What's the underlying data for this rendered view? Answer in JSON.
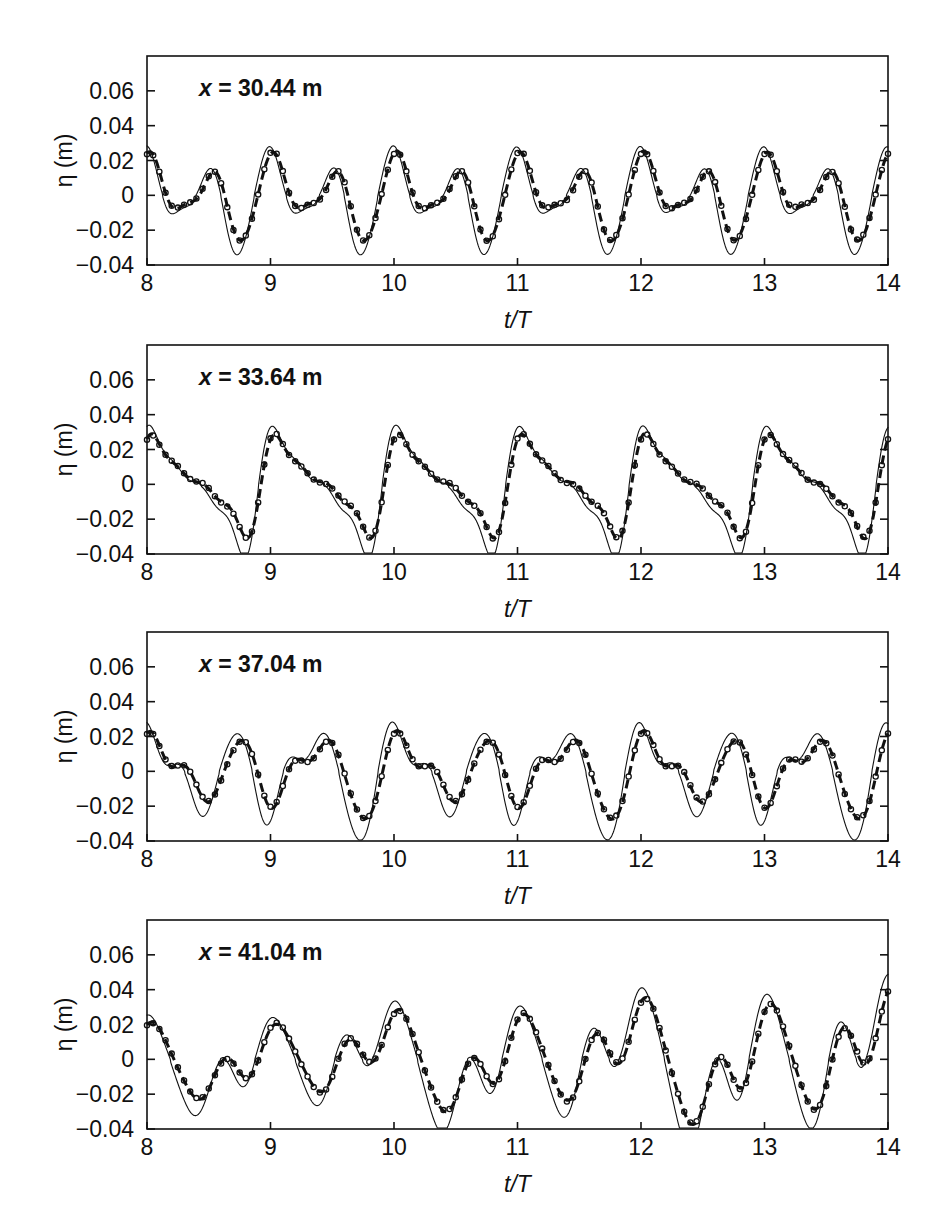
{
  "figure": {
    "title": "",
    "panel_count": 4
  },
  "axes": {
    "xlabel": "t/T",
    "ylabel": "η (m)",
    "xticks": [
      "8",
      "9",
      "10",
      "11",
      "12",
      "13",
      "14"
    ],
    "xtick_values": [
      8,
      9,
      10,
      11,
      12,
      13,
      14
    ],
    "yticks": [
      "0.06",
      "0.04",
      "0.02",
      "0",
      "−0.02",
      "−0.04"
    ],
    "ytick_values": [
      0.06,
      0.04,
      0.02,
      0,
      -0.02,
      -0.04
    ],
    "xlim": [
      8,
      14
    ],
    "ylim": [
      -0.04,
      0.08
    ],
    "grid": false,
    "line_color": "#111111"
  },
  "legend": {
    "series_names": [
      "solid-line",
      "dashed-line",
      "circle-markers"
    ],
    "position": "none"
  },
  "panels": [
    {
      "id": "panel-1",
      "note_prefix": "x",
      "note_equals": "=",
      "note_value": "30.44 m",
      "note": "x = 30.44 m"
    },
    {
      "id": "panel-2",
      "note_prefix": "x",
      "note_equals": "=",
      "note_value": "33.64 m",
      "note": "x = 33.64 m"
    },
    {
      "id": "panel-3",
      "note_prefix": "x",
      "note_equals": "=",
      "note_value": "37.04 m",
      "note": "x = 37.04 m"
    },
    {
      "id": "panel-4",
      "note_prefix": "x",
      "note_equals": "=",
      "note_value": "41.04 m",
      "note": "x = 41.04 m"
    }
  ],
  "chart_data": [
    {
      "type": "line",
      "title": "x = 30.44 m",
      "xlabel": "t/T",
      "ylabel": "η (m)",
      "xlim": [
        8,
        14
      ],
      "ylim": [
        -0.04,
        0.08
      ],
      "grid": false,
      "harmonics": [
        {
          "name": "primary",
          "amp": 0.0175,
          "freq": 2.0,
          "phase": 1.3,
          "mean": 0.0
        },
        {
          "name": "secondary",
          "amp": 0.0075,
          "freq": 1.0,
          "phase": 0.55,
          "mean": 0.0
        },
        {
          "name": "third",
          "amp": 0.004,
          "freq": 3.0,
          "phase": 2.4,
          "mean": 0.0
        },
        {
          "name": "fourth",
          "amp": 0.0022,
          "freq": 4.0,
          "phase": 0.2,
          "mean": 0.0
        }
      ],
      "series": [
        {
          "name": "solid-line",
          "style": "solid",
          "amp_scale": 1.12,
          "trough_bias": -0.0028,
          "phase_shift": 0.03
        },
        {
          "name": "dashed-line",
          "style": "dashed",
          "amp_scale": 1.0,
          "trough_bias": 0.0,
          "phase_shift": 0.0
        },
        {
          "name": "circle-markers",
          "style": "markers",
          "amp_scale": 1.0,
          "trough_bias": 0.0,
          "phase_shift": 0.0,
          "marker_count": 120
        }
      ]
    },
    {
      "type": "line",
      "title": "x = 33.64 m",
      "xlabel": "t/T",
      "ylabel": "η (m)",
      "xlim": [
        8,
        14
      ],
      "ylim": [
        -0.04,
        0.08
      ],
      "grid": false,
      "harmonics": [
        {
          "name": "primary",
          "amp": 0.02,
          "freq": 1.0,
          "phase": 0.45,
          "mean": 0.0
        },
        {
          "name": "secondary",
          "amp": 0.0115,
          "freq": 2.0,
          "phase": 0.95,
          "mean": 0.0
        },
        {
          "name": "third",
          "amp": 0.0055,
          "freq": 3.0,
          "phase": 1.45,
          "mean": 0.0
        },
        {
          "name": "fourth",
          "amp": 0.0028,
          "freq": 4.0,
          "phase": 2.1,
          "mean": 0.0
        }
      ],
      "series": [
        {
          "name": "solid-line",
          "style": "solid",
          "amp_scale": 1.16,
          "trough_bias": -0.003,
          "phase_shift": 0.02
        },
        {
          "name": "dashed-line",
          "style": "dashed",
          "amp_scale": 1.0,
          "trough_bias": 0.0,
          "phase_shift": 0.0
        },
        {
          "name": "circle-markers",
          "style": "markers",
          "amp_scale": 1.0,
          "trough_bias": 0.0,
          "phase_shift": 0.0,
          "marker_count": 120
        }
      ]
    },
    {
      "type": "line",
      "title": "x = 37.04 m",
      "xlabel": "t/T",
      "ylabel": "η (m)",
      "xlim": [
        8,
        14
      ],
      "ylim": [
        -0.04,
        0.08
      ],
      "grid": false,
      "harmonics": [
        {
          "name": "primary",
          "amp": 0.0165,
          "freq": 1.5,
          "phase": 0.8,
          "mean": 0.0
        },
        {
          "name": "secondary",
          "amp": 0.0082,
          "freq": 2.5,
          "phase": 2.1,
          "mean": 0.0
        },
        {
          "name": "third",
          "amp": 0.0048,
          "freq": 1.0,
          "phase": 0.1,
          "mean": 0.0
        },
        {
          "name": "fourth",
          "amp": 0.0026,
          "freq": 3.5,
          "phase": 1.1,
          "mean": 0.0
        }
      ],
      "series": [
        {
          "name": "solid-line",
          "style": "solid",
          "amp_scale": 1.22,
          "trough_bias": -0.0032,
          "phase_shift": 0.04
        },
        {
          "name": "dashed-line",
          "style": "dashed",
          "amp_scale": 1.0,
          "trough_bias": 0.0,
          "phase_shift": 0.0
        },
        {
          "name": "circle-markers",
          "style": "markers",
          "amp_scale": 1.0,
          "trough_bias": 0.0,
          "phase_shift": 0.0,
          "marker_count": 120
        }
      ]
    },
    {
      "type": "line",
      "title": "x = 41.04 m",
      "xlabel": "t/T",
      "ylabel": "η (m)",
      "xlim": [
        8,
        14
      ],
      "ylim": [
        -0.04,
        0.08
      ],
      "grid": false,
      "harmonics": [
        {
          "name": "primary",
          "amp": 0.012,
          "freq": 1.0,
          "phase": 1.7,
          "mean": 0.0
        },
        {
          "name": "secondary",
          "amp": 0.0095,
          "freq": 2.0,
          "phase": 0.3,
          "mean": 0.0
        },
        {
          "name": "third",
          "amp": 0.0045,
          "freq": 0.5,
          "phase": 2.6,
          "mean": 0.0
        },
        {
          "name": "fourth",
          "amp": 0.003,
          "freq": 3.0,
          "phase": 1.9,
          "mean": 0.0
        }
      ],
      "growth": 0.16,
      "series": [
        {
          "name": "solid-line",
          "style": "solid",
          "amp_scale": 1.18,
          "trough_bias": -0.003,
          "phase_shift": 0.03
        },
        {
          "name": "dashed-line",
          "style": "dashed",
          "amp_scale": 1.0,
          "trough_bias": 0.0,
          "phase_shift": 0.0
        },
        {
          "name": "circle-markers",
          "style": "markers",
          "amp_scale": 1.0,
          "trough_bias": 0.0,
          "phase_shift": 0.0,
          "marker_count": 120
        }
      ]
    }
  ]
}
